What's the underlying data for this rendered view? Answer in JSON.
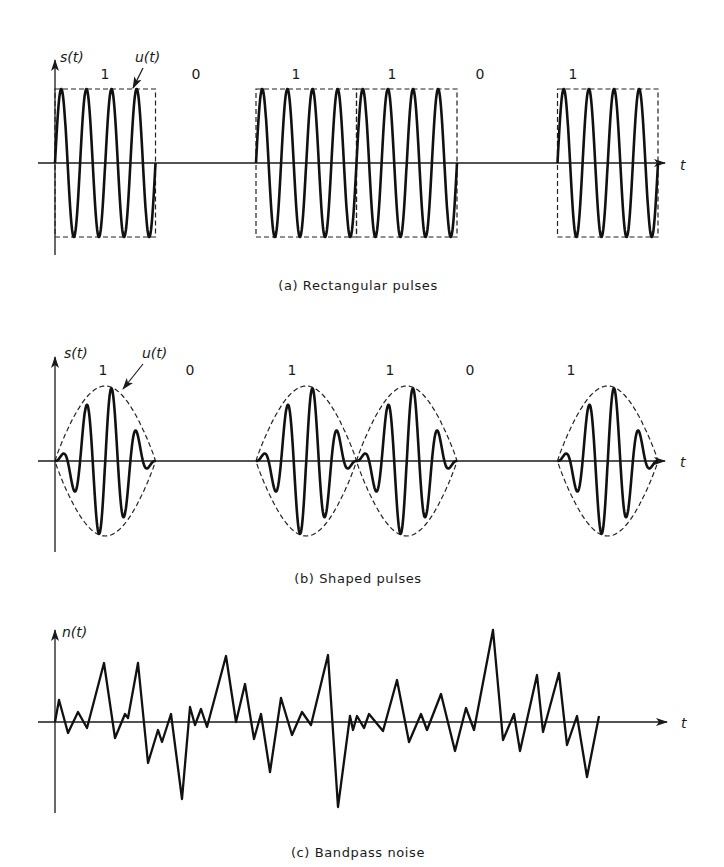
{
  "panels": {
    "a": {
      "ylabel": "s(t)",
      "envelope_label": "u(t)",
      "xlabel": "t",
      "caption": "(a) Rectangular pulses",
      "bits": [
        "1",
        "0",
        "1",
        "1",
        "0",
        "1"
      ]
    },
    "b": {
      "ylabel": "s(t)",
      "envelope_label": "u(t)",
      "xlabel": "t",
      "caption": "(b) Shaped pulses",
      "bits": [
        "1",
        "0",
        "1",
        "1",
        "0",
        "1"
      ]
    },
    "c": {
      "ylabel": "n(t)",
      "xlabel": "t",
      "caption": "(c) Bandpass noise"
    }
  },
  "chart_data": [
    {
      "type": "line",
      "title": "(a) Rectangular pulses",
      "ylabel": "s(t)",
      "xlabel": "t",
      "annotation": "u(t) (dashed rectangular envelope)",
      "bit_sequence": [
        1,
        0,
        1,
        1,
        0,
        1
      ],
      "cycles_per_bit": 4,
      "envelope": "rectangular",
      "geometry": {
        "axis_y": 163,
        "amp_px": 74,
        "x0": 55,
        "bit_width_px": 100.5,
        "arrow_end": 665
      }
    },
    {
      "type": "line",
      "title": "(b) Shaped pulses",
      "ylabel": "s(t)",
      "xlabel": "t",
      "annotation": "u(t) (dashed shaped envelope)",
      "bit_sequence": [
        1,
        0,
        1,
        1,
        0,
        1
      ],
      "cycles_per_bit": 4,
      "envelope": "raised-cosine",
      "geometry": {
        "axis_y": 461,
        "amp_px": 75,
        "x0": 55,
        "bit_width_px": 100.5,
        "arrow_end": 665
      }
    },
    {
      "type": "line",
      "title": "(c) Bandpass noise",
      "ylabel": "n(t)",
      "xlabel": "t",
      "geometry": {
        "axis_y": 722,
        "arrow_end": 667
      },
      "points": [
        [
          55,
          722
        ],
        [
          59,
          700
        ],
        [
          68,
          733
        ],
        [
          78,
          712
        ],
        [
          87,
          728
        ],
        [
          104,
          663
        ],
        [
          115,
          738
        ],
        [
          125,
          714
        ],
        [
          128,
          718
        ],
        [
          138,
          663
        ],
        [
          148,
          763
        ],
        [
          158,
          730
        ],
        [
          162,
          742
        ],
        [
          171,
          714
        ],
        [
          182,
          799
        ],
        [
          190,
          707
        ],
        [
          195,
          725
        ],
        [
          201,
          709
        ],
        [
          207,
          727
        ],
        [
          226,
          656
        ],
        [
          236,
          722
        ],
        [
          245,
          684
        ],
        [
          254,
          739
        ],
        [
          261,
          714
        ],
        [
          270,
          772
        ],
        [
          281,
          698
        ],
        [
          292,
          735
        ],
        [
          302,
          712
        ],
        [
          311,
          725
        ],
        [
          328,
          655
        ],
        [
          338,
          807
        ],
        [
          350,
          716
        ],
        [
          353,
          730
        ],
        [
          357,
          716
        ],
        [
          364,
          728
        ],
        [
          369,
          714
        ],
        [
          383,
          731
        ],
        [
          397,
          680
        ],
        [
          409,
          742
        ],
        [
          421,
          714
        ],
        [
          427,
          730
        ],
        [
          441,
          694
        ],
        [
          455,
          751
        ],
        [
          466,
          708
        ],
        [
          474,
          730
        ],
        [
          493,
          630
        ],
        [
          503,
          740
        ],
        [
          514,
          714
        ],
        [
          520,
          751
        ],
        [
          537,
          675
        ],
        [
          543,
          732
        ],
        [
          559,
          673
        ],
        [
          567,
          745
        ],
        [
          577,
          716
        ],
        [
          587,
          777
        ],
        [
          599,
          716
        ]
      ]
    }
  ]
}
